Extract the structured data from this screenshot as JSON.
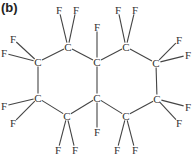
{
  "panel_label": "(b)",
  "molecule": {
    "name": "perfluorodecalin",
    "formula": "C10F18",
    "atoms": [
      {
        "id": "c1",
        "symbol": "C",
        "x": 68,
        "y": 47
      },
      {
        "id": "c2",
        "symbol": "C",
        "x": 38,
        "y": 62
      },
      {
        "id": "c3",
        "symbol": "C",
        "x": 38,
        "y": 98
      },
      {
        "id": "c4",
        "symbol": "C",
        "x": 67,
        "y": 116
      },
      {
        "id": "c5",
        "symbol": "C",
        "x": 97,
        "y": 62
      },
      {
        "id": "c6",
        "symbol": "C",
        "x": 97,
        "y": 98
      },
      {
        "id": "c7",
        "symbol": "C",
        "x": 126,
        "y": 47
      },
      {
        "id": "c8",
        "symbol": "C",
        "x": 156,
        "y": 63
      },
      {
        "id": "c9",
        "symbol": "C",
        "x": 157,
        "y": 99
      },
      {
        "id": "c10",
        "symbol": "C",
        "x": 126,
        "y": 116
      },
      {
        "id": "f1",
        "symbol": "F",
        "x": 59,
        "y": 10
      },
      {
        "id": "f2",
        "symbol": "F",
        "x": 76,
        "y": 10
      },
      {
        "id": "f3",
        "symbol": "F",
        "x": 13,
        "y": 39
      },
      {
        "id": "f4",
        "symbol": "F",
        "x": 4,
        "y": 53
      },
      {
        "id": "f5",
        "symbol": "F",
        "x": 4,
        "y": 106
      },
      {
        "id": "f6",
        "symbol": "F",
        "x": 13,
        "y": 123
      },
      {
        "id": "f7",
        "symbol": "F",
        "x": 58,
        "y": 150
      },
      {
        "id": "f8",
        "symbol": "F",
        "x": 75,
        "y": 150
      },
      {
        "id": "f9",
        "symbol": "F",
        "x": 97,
        "y": 27
      },
      {
        "id": "f10",
        "symbol": "F",
        "x": 97,
        "y": 132
      },
      {
        "id": "f11",
        "symbol": "F",
        "x": 118,
        "y": 10
      },
      {
        "id": "f12",
        "symbol": "F",
        "x": 135,
        "y": 10
      },
      {
        "id": "f13",
        "symbol": "F",
        "x": 179,
        "y": 40
      },
      {
        "id": "f14",
        "symbol": "F",
        "x": 188,
        "y": 55
      },
      {
        "id": "f15",
        "symbol": "F",
        "x": 188,
        "y": 107
      },
      {
        "id": "f16",
        "symbol": "F",
        "x": 179,
        "y": 123
      },
      {
        "id": "f17",
        "symbol": "F",
        "x": 117,
        "y": 150
      },
      {
        "id": "f18",
        "symbol": "F",
        "x": 135,
        "y": 150
      }
    ],
    "bonds": [
      [
        "c1",
        "c2"
      ],
      [
        "c2",
        "c3"
      ],
      [
        "c3",
        "c4"
      ],
      [
        "c4",
        "c6"
      ],
      [
        "c6",
        "c5"
      ],
      [
        "c5",
        "c1"
      ],
      [
        "c5",
        "c7"
      ],
      [
        "c7",
        "c8"
      ],
      [
        "c8",
        "c9"
      ],
      [
        "c9",
        "c10"
      ],
      [
        "c10",
        "c6"
      ],
      [
        "c1",
        "f1"
      ],
      [
        "c1",
        "f2"
      ],
      [
        "c2",
        "f3"
      ],
      [
        "c2",
        "f4"
      ],
      [
        "c3",
        "f5"
      ],
      [
        "c3",
        "f6"
      ],
      [
        "c4",
        "f7"
      ],
      [
        "c4",
        "f8"
      ],
      [
        "c5",
        "f9"
      ],
      [
        "c6",
        "f10"
      ],
      [
        "c7",
        "f11"
      ],
      [
        "c7",
        "f12"
      ],
      [
        "c8",
        "f13"
      ],
      [
        "c8",
        "f14"
      ],
      [
        "c9",
        "f15"
      ],
      [
        "c9",
        "f16"
      ],
      [
        "c10",
        "f17"
      ],
      [
        "c10",
        "f18"
      ]
    ]
  }
}
